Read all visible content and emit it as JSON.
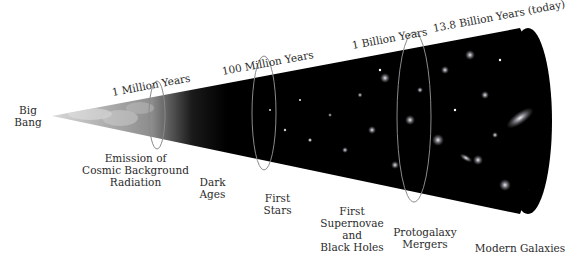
{
  "diagram": {
    "start_label": [
      "Big",
      "Bang"
    ],
    "time_markers": [
      {
        "label": "1 Million Years"
      },
      {
        "label": "100 Million Years"
      },
      {
        "label": "1 Billion Years"
      },
      {
        "label": "13.8 Billion Years (today)"
      }
    ],
    "epochs": [
      {
        "lines": [
          "Emission of",
          "Cosmic Background",
          "Radiation"
        ]
      },
      {
        "lines": [
          "Dark",
          "Ages"
        ]
      },
      {
        "lines": [
          "First",
          "Stars"
        ]
      },
      {
        "lines": [
          "First",
          "Supernovae",
          "and",
          "Black Holes"
        ]
      },
      {
        "lines": [
          "Protogalaxy",
          "Mergers"
        ]
      },
      {
        "lines": [
          "Modern Galaxies"
        ]
      }
    ],
    "colors": {
      "cone_early": "#b8b8b8",
      "cone_dark": "#000000",
      "ring": "#8a8a8a",
      "text": "#2b2b2b"
    }
  }
}
